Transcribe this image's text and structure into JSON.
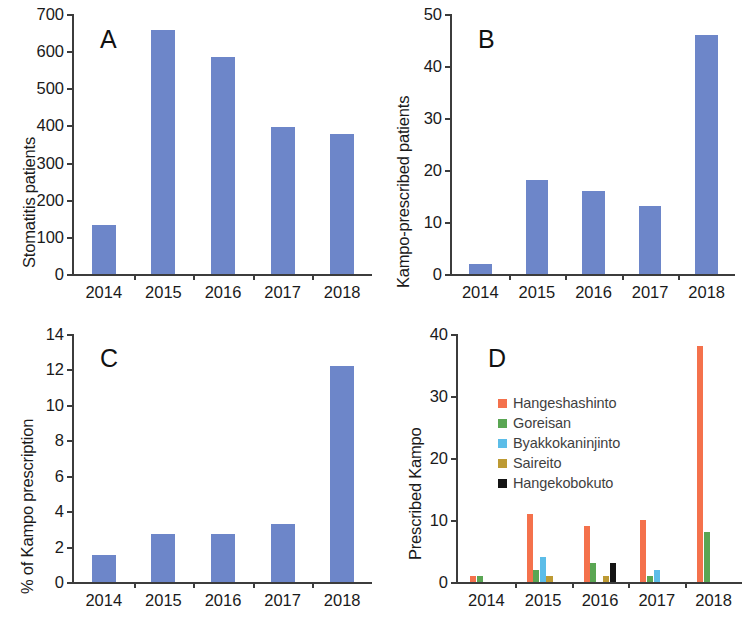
{
  "figure": {
    "background": "#ffffff",
    "series_color_blue": "#6d86c9",
    "panels": [
      "A",
      "B",
      "C",
      "D"
    ]
  },
  "panel_a": {
    "letter": "A",
    "ylabel": "Stomatitis patients",
    "yticks": [
      "0",
      "100",
      "200",
      "300",
      "400",
      "500",
      "600",
      "700"
    ],
    "xticks": [
      "2014",
      "2015",
      "2016",
      "2017",
      "2018"
    ]
  },
  "panel_b": {
    "letter": "B",
    "ylabel": "Kampo-prescribed patients",
    "yticks": [
      "0",
      "10",
      "20",
      "30",
      "40",
      "50"
    ],
    "xticks": [
      "2014",
      "2015",
      "2016",
      "2017",
      "2018"
    ]
  },
  "panel_c": {
    "letter": "C",
    "ylabel": "% of Kampo prescription",
    "yticks": [
      "0",
      "2",
      "4",
      "6",
      "8",
      "10",
      "12",
      "14"
    ],
    "xticks": [
      "2014",
      "2015",
      "2016",
      "2017",
      "2018"
    ]
  },
  "panel_d": {
    "letter": "D",
    "ylabel": "Prescribed Kampo",
    "yticks": [
      "0",
      "10",
      "20",
      "30",
      "40"
    ],
    "xticks": [
      "2014",
      "2015",
      "2016",
      "2017",
      "2018"
    ],
    "legend": [
      {
        "label": "Hangeshashinto",
        "color": "#f4714c"
      },
      {
        "label": "Goreisan",
        "color": "#5aa653"
      },
      {
        "label": "Byakkokaninjinto",
        "color": "#5cbde8"
      },
      {
        "label": "Saireito",
        "color": "#bd9a33"
      },
      {
        "label": "Hangekobokuto",
        "color": "#141414"
      }
    ]
  },
  "chart_data": [
    {
      "type": "bar",
      "panel": "A",
      "title": "A",
      "xlabel": "",
      "ylabel": "Stomatitis patients",
      "categories": [
        "2014",
        "2015",
        "2016",
        "2017",
        "2018"
      ],
      "values": [
        132,
        658,
        585,
        396,
        378
      ],
      "ylim": [
        0,
        700
      ],
      "ytick_step": 100,
      "grid": false,
      "color": "#6d86c9"
    },
    {
      "type": "bar",
      "panel": "B",
      "title": "B",
      "xlabel": "",
      "ylabel": "Kampo-prescribed patients",
      "categories": [
        "2014",
        "2015",
        "2016",
        "2017",
        "2018"
      ],
      "values": [
        2,
        18,
        16,
        13,
        46
      ],
      "ylim": [
        0,
        50
      ],
      "ytick_step": 10,
      "grid": false,
      "color": "#6d86c9"
    },
    {
      "type": "bar",
      "panel": "C",
      "title": "C",
      "xlabel": "",
      "ylabel": "% of Kampo prescription",
      "categories": [
        "2014",
        "2015",
        "2016",
        "2017",
        "2018"
      ],
      "values": [
        1.5,
        2.7,
        2.7,
        3.3,
        12.2
      ],
      "ylim": [
        0,
        14
      ],
      "ytick_step": 2,
      "grid": false,
      "color": "#6d86c9"
    },
    {
      "type": "bar",
      "panel": "D",
      "title": "D",
      "xlabel": "",
      "ylabel": "Prescribed Kampo",
      "categories": [
        "2014",
        "2015",
        "2016",
        "2017",
        "2018"
      ],
      "ylim": [
        0,
        40
      ],
      "ytick_step": 10,
      "grid": false,
      "legend_position": "upper-left-inside",
      "series": [
        {
          "name": "Hangeshashinto",
          "color": "#f4714c",
          "values": [
            1,
            11,
            9,
            10,
            38
          ]
        },
        {
          "name": "Goreisan",
          "color": "#5aa653",
          "values": [
            1,
            2,
            3,
            1,
            8
          ]
        },
        {
          "name": "Byakkokaninjinto",
          "color": "#5cbde8",
          "values": [
            0,
            4,
            0,
            2,
            0
          ]
        },
        {
          "name": "Saireito",
          "color": "#bd9a33",
          "values": [
            0,
            1,
            1,
            0,
            0
          ]
        },
        {
          "name": "Hangekobokuto",
          "color": "#141414",
          "values": [
            0,
            0,
            3,
            0,
            0
          ]
        }
      ]
    }
  ]
}
